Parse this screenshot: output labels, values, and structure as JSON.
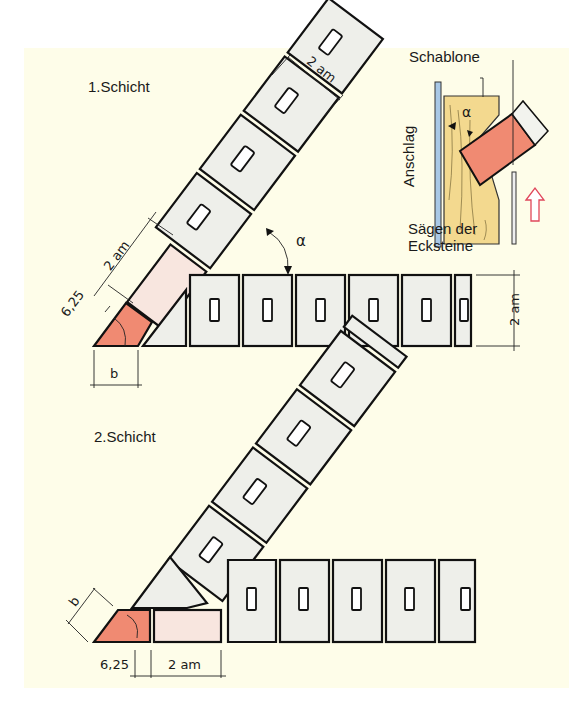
{
  "diagram": {
    "layer1": {
      "title": "1.Schicht",
      "dims": {
        "brick_width": "2 am",
        "run_height": "2 am",
        "corner_offset": "6,25",
        "diag_length": "2 am",
        "cut_width": "b",
        "angle": "α"
      }
    },
    "layer2": {
      "title": "2.Schicht",
      "dims": {
        "cut_width": "b",
        "corner_offset": "6,25",
        "run_length": "2 am"
      }
    },
    "inset": {
      "template_label": "Schablone",
      "stop_label": "Anschlag",
      "angle": "α",
      "caption_line1": "Sägen der",
      "caption_line2": "Ecksteine"
    },
    "colors": {
      "background": "#fefde9",
      "brick_fill": "#eeefea",
      "cut_brick": "#f08a72",
      "pale_brick": "#f8e6df",
      "template_wood": "#f3d98f",
      "stop_rail": "#a9c8e6",
      "arrow_outline": "#e0475b"
    }
  }
}
